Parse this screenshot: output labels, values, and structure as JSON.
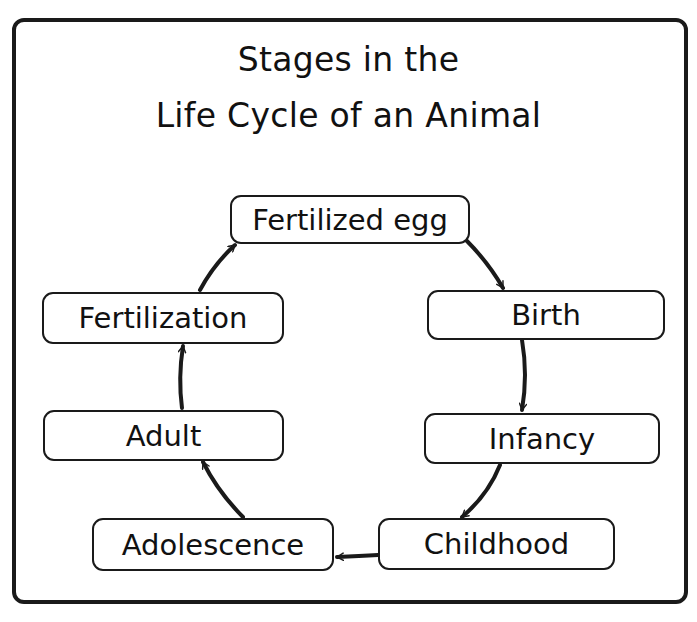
{
  "diagram": {
    "title_line1": "Stages in the",
    "title_line2": "Life Cycle of an Animal",
    "nodes": [
      {
        "id": "fertilized-egg",
        "label": "Fertilized egg"
      },
      {
        "id": "birth",
        "label": "Birth"
      },
      {
        "id": "infancy",
        "label": "Infancy"
      },
      {
        "id": "childhood",
        "label": "Childhood"
      },
      {
        "id": "adolescence",
        "label": "Adolescence"
      },
      {
        "id": "adult",
        "label": "Adult"
      },
      {
        "id": "fertilization",
        "label": "Fertilization"
      }
    ],
    "edges": [
      {
        "from": "fertilized-egg",
        "to": "birth"
      },
      {
        "from": "birth",
        "to": "infancy"
      },
      {
        "from": "infancy",
        "to": "childhood"
      },
      {
        "from": "childhood",
        "to": "adolescence"
      },
      {
        "from": "adolescence",
        "to": "adult"
      },
      {
        "from": "adult",
        "to": "fertilization"
      },
      {
        "from": "fertilization",
        "to": "fertilized-egg"
      }
    ],
    "colors": {
      "stroke": "#1a1a1a",
      "background": "#ffffff"
    }
  }
}
